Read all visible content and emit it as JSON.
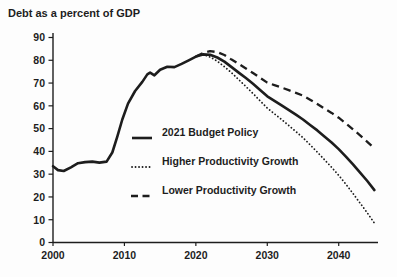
{
  "chart_data": {
    "type": "line",
    "title": "Debt as a percent of GDP",
    "xlabel": "",
    "ylabel": "Debt as a percent of GDP",
    "x_axis": {
      "ticks": [
        2000,
        2010,
        2020,
        2030,
        2040
      ],
      "range": [
        2000,
        2045.5
      ]
    },
    "y_axis": {
      "ticks": [
        0,
        10,
        20,
        30,
        40,
        50,
        60,
        70,
        80,
        90
      ],
      "range": [
        0,
        90
      ]
    },
    "grid": false,
    "legend_position": "inside-left-middle",
    "line_color": "#1d1d1d",
    "background_color": "#fdfdfd",
    "series": [
      {
        "name": "2021 Budget Policy",
        "style": "solid",
        "color": "#1d1d1d",
        "points": [
          [
            2000,
            33.5
          ],
          [
            2000.7,
            31.8
          ],
          [
            2001.5,
            31.4
          ],
          [
            2002.5,
            33
          ],
          [
            2003.5,
            34.8
          ],
          [
            2004.5,
            35.3
          ],
          [
            2005.5,
            35.5
          ],
          [
            2006.5,
            35.1
          ],
          [
            2007.5,
            35.5
          ],
          [
            2008.3,
            39.5
          ],
          [
            2009,
            46.5
          ],
          [
            2009.7,
            54
          ],
          [
            2010.5,
            61
          ],
          [
            2011.5,
            66.5
          ],
          [
            2012.5,
            70.5
          ],
          [
            2013.2,
            73.8
          ],
          [
            2013.6,
            74.6
          ],
          [
            2014.2,
            73.4
          ],
          [
            2015,
            75.8
          ],
          [
            2016,
            77.2
          ],
          [
            2017,
            77
          ],
          [
            2018,
            78.4
          ],
          [
            2019,
            80
          ],
          [
            2020,
            81.6
          ],
          [
            2021,
            82.6
          ],
          [
            2022,
            82.4
          ],
          [
            2023,
            81.2
          ],
          [
            2024,
            79.4
          ],
          [
            2025,
            77
          ],
          [
            2026,
            74.6
          ],
          [
            2027,
            72.2
          ],
          [
            2028,
            69.7
          ],
          [
            2029,
            67
          ],
          [
            2030,
            64.2
          ],
          [
            2032,
            60.2
          ],
          [
            2034,
            56.1
          ],
          [
            2035,
            54
          ],
          [
            2036,
            51.6
          ],
          [
            2037,
            49.2
          ],
          [
            2038,
            46.6
          ],
          [
            2039,
            43.9
          ],
          [
            2040,
            41
          ],
          [
            2041,
            37.7
          ],
          [
            2042,
            34.3
          ],
          [
            2043,
            30.7
          ],
          [
            2044,
            27
          ],
          [
            2045,
            23
          ]
        ]
      },
      {
        "name": "Higher Productivity Growth",
        "style": "dotted",
        "color": "#1d1d1d",
        "points": [
          [
            2021,
            82.6
          ],
          [
            2022,
            81.4
          ],
          [
            2023,
            79.6
          ],
          [
            2024,
            77.2
          ],
          [
            2025,
            74.5
          ],
          [
            2026,
            71.5
          ],
          [
            2027,
            68.5
          ],
          [
            2028,
            65.4
          ],
          [
            2029,
            62.2
          ],
          [
            2030,
            59
          ],
          [
            2031,
            56.5
          ],
          [
            2032,
            54
          ],
          [
            2033,
            51.4
          ],
          [
            2034,
            48.7
          ],
          [
            2035,
            46
          ],
          [
            2036,
            42.9
          ],
          [
            2037,
            39.7
          ],
          [
            2038,
            36.4
          ],
          [
            2039,
            33
          ],
          [
            2040,
            29.5
          ],
          [
            2041,
            25.6
          ],
          [
            2042,
            21.5
          ],
          [
            2043,
            17.3
          ],
          [
            2044,
            13
          ],
          [
            2045,
            8.5
          ]
        ]
      },
      {
        "name": "Lower Productivity Growth",
        "style": "dashed",
        "color": "#1d1d1d",
        "points": [
          [
            2020,
            81.6
          ],
          [
            2021,
            83.2
          ],
          [
            2022,
            84
          ],
          [
            2023,
            83.6
          ],
          [
            2024,
            82.3
          ],
          [
            2025,
            80.3
          ],
          [
            2026,
            78.4
          ],
          [
            2027,
            76.4
          ],
          [
            2028,
            74.4
          ],
          [
            2029,
            72.3
          ],
          [
            2030,
            70.2
          ],
          [
            2031,
            69.1
          ],
          [
            2032,
            68
          ],
          [
            2033,
            66.9
          ],
          [
            2034,
            65.7
          ],
          [
            2035,
            64.5
          ],
          [
            2036,
            62.7
          ],
          [
            2037,
            60.8
          ],
          [
            2038,
            58.8
          ],
          [
            2039,
            56.9
          ],
          [
            2040,
            54.8
          ],
          [
            2041,
            52.3
          ],
          [
            2042,
            49.7
          ],
          [
            2043,
            47
          ],
          [
            2044,
            44.2
          ],
          [
            2045,
            41.3
          ]
        ]
      }
    ]
  }
}
